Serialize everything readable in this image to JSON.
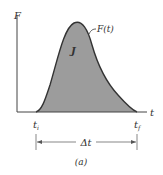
{
  "diagram": {
    "y_axis_label": "F",
    "x_axis_label": "t",
    "curve_label": "F(t)",
    "area_label": "J",
    "start_label": "t",
    "start_sub": "i",
    "end_label": "t",
    "end_sub": "f",
    "interval_label": "Δt",
    "caption": "(a)",
    "colors": {
      "fill": "#9c9c9c",
      "stroke": "#333333",
      "axis": "#444444"
    }
  }
}
